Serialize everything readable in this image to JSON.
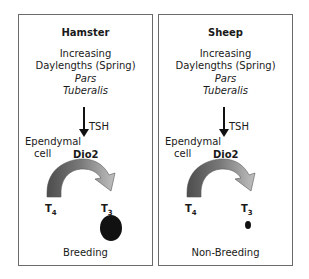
{
  "panels": [
    {
      "title": "Hamster",
      "increasing_line1": "Increasing",
      "increasing_line2": "Daylengths (Spring)",
      "pars_line1": "Pars",
      "pars_line2": "Tuberalis",
      "tsh": "TSH",
      "ependymal_line1": "Ependymal",
      "ependymal_line2": "cell",
      "enzyme": "Dio2",
      "t4": "T4",
      "t3": "T3",
      "outcome_marker": "large-black-oval",
      "state": "Breeding"
    },
    {
      "title": "Sheep",
      "increasing_line1": "Increasing",
      "increasing_line2": "Daylengths (Spring)",
      "pars_line1": "Pars",
      "pars_line2": "Tuberalis",
      "tsh": "TSH",
      "ependymal_line1": "Ependymal",
      "ependymal_line2": "cell",
      "enzyme": "Dio2",
      "t4": "T4",
      "t3": "T3",
      "outcome_marker": "small-black-dot",
      "state": "Non-Breeding"
    }
  ],
  "subscripts": {
    "t4": "4",
    "t3": "3"
  },
  "colors": {
    "border": "#6a6a6a",
    "arrow_dark": "#555555",
    "arrow_light": "#b5b5b5",
    "marker": "#111111"
  }
}
